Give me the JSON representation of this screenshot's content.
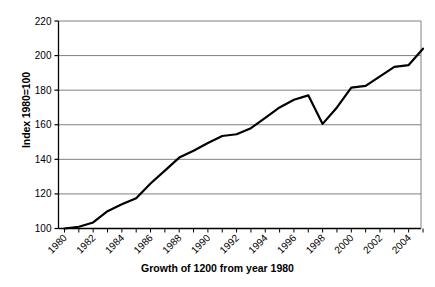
{
  "chart_data": {
    "type": "line",
    "title": "",
    "xlabel": "Growth of 1200 from year 1980",
    "ylabel": "Index 1980=100",
    "ylim": [
      100,
      220
    ],
    "xlim": [
      1980,
      2005
    ],
    "ytick_step": 20,
    "yticks": [
      100,
      120,
      140,
      160,
      180,
      200,
      220
    ],
    "xticks": [
      1980,
      1982,
      1984,
      1986,
      1988,
      1990,
      1992,
      1994,
      1996,
      1998,
      2000,
      2002,
      2004
    ],
    "xtick_labels": [
      "1980",
      "1982",
      "1984",
      "1986",
      "1988",
      "1990",
      "1992",
      "1994",
      "1996",
      "1998",
      "2000",
      "2002",
      "2004"
    ],
    "xtick_rotation": 45,
    "grid": "horizontal",
    "grid_color": "#808080",
    "legend": "none",
    "line_color": "#000000",
    "line_width": 2.2,
    "x": [
      1980,
      1981,
      1982,
      1983,
      1984,
      1985,
      1986,
      1987,
      1988,
      1989,
      1990,
      1991,
      1992,
      1993,
      1994,
      1995,
      1996,
      1997,
      1998,
      1999,
      2000,
      2001,
      2002,
      2003,
      2004,
      2005
    ],
    "series": [
      {
        "name": "Index 1980=100",
        "values": [
          100,
          101,
          103.5,
          110,
          114,
          117.5,
          126,
          133.5,
          141,
          145,
          149.5,
          153.5,
          154.5,
          158,
          164,
          170,
          174.5,
          177,
          160.5,
          170,
          181.5,
          182.5,
          188,
          193.5,
          194.5,
          204
        ]
      }
    ]
  }
}
